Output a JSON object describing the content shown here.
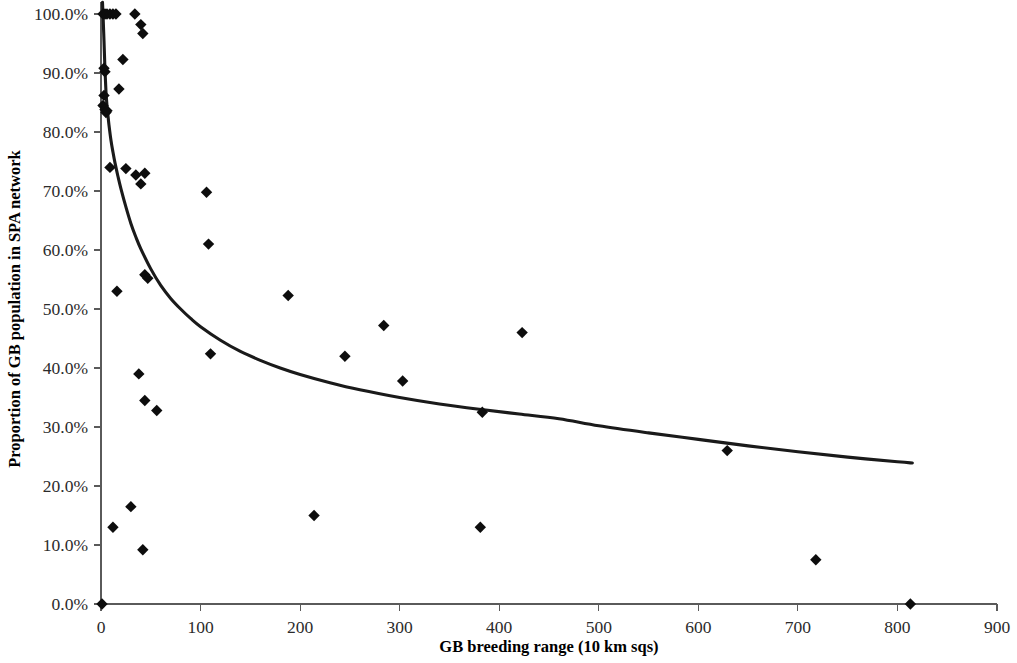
{
  "chart_data": {
    "type": "scatter",
    "title": "",
    "subtitle": "",
    "xlabel": "GB breeding range (10 km sqs)",
    "ylabel": "Proportion of GB population in SPA network",
    "xlim": [
      0,
      900
    ],
    "ylim": [
      0,
      1.0
    ],
    "xticks": [
      0,
      100,
      200,
      300,
      400,
      500,
      600,
      700,
      800,
      900
    ],
    "xticklabels": [
      "0",
      "100",
      "200",
      "300",
      "400",
      "500",
      "600",
      "700",
      "800",
      "900"
    ],
    "yticks": [
      0,
      0.1,
      0.2,
      0.3,
      0.4,
      0.5,
      0.6,
      0.7,
      0.8,
      0.9,
      1.0
    ],
    "yticklabels": [
      "0.0%",
      "10.0%",
      "20.0%",
      "30.0%",
      "40.0%",
      "50.0%",
      "60.0%",
      "70.0%",
      "80.0%",
      "90.0%",
      "100.0%"
    ],
    "grid": false,
    "legend": null,
    "legend_position": "none",
    "marker_shape": "diamond",
    "marker_color": "#0d0d0d",
    "marker_size": 9,
    "series": [
      {
        "name": "Species",
        "points": [
          [
            2,
            1.0
          ],
          [
            4,
            1.0
          ],
          [
            6,
            1.0
          ],
          [
            9,
            1.0
          ],
          [
            12,
            1.0
          ],
          [
            15,
            1.0
          ],
          [
            34,
            1.0
          ],
          [
            40,
            0.982
          ],
          [
            42,
            0.967
          ],
          [
            3,
            0.908
          ],
          [
            4,
            0.902
          ],
          [
            22,
            0.923
          ],
          [
            18,
            0.873
          ],
          [
            3,
            0.862
          ],
          [
            2,
            0.845
          ],
          [
            4,
            0.838
          ],
          [
            5,
            0.833
          ],
          [
            6,
            0.836
          ],
          [
            9,
            0.74
          ],
          [
            25,
            0.738
          ],
          [
            35,
            0.727
          ],
          [
            44,
            0.73
          ],
          [
            40,
            0.712
          ],
          [
            106,
            0.698
          ],
          [
            108,
            0.61
          ],
          [
            44,
            0.558
          ],
          [
            47,
            0.552
          ],
          [
            16,
            0.53
          ],
          [
            188,
            0.523
          ],
          [
            284,
            0.472
          ],
          [
            423,
            0.46
          ],
          [
            245,
            0.42
          ],
          [
            110,
            0.424
          ],
          [
            303,
            0.378
          ],
          [
            38,
            0.39
          ],
          [
            383,
            0.325
          ],
          [
            629,
            0.26
          ],
          [
            44,
            0.345
          ],
          [
            56,
            0.328
          ],
          [
            30,
            0.165
          ],
          [
            214,
            0.15
          ],
          [
            381,
            0.13
          ],
          [
            12,
            0.13
          ],
          [
            42,
            0.092
          ],
          [
            718,
            0.075
          ],
          [
            813,
            0.0
          ],
          [
            1,
            0.0
          ]
        ]
      }
    ],
    "fit_curve": {
      "name": "power-law fit",
      "color": "#1a1a1a",
      "points": [
        [
          1.5,
          1.02
        ],
        [
          2,
          1.0
        ],
        [
          3,
          0.955
        ],
        [
          4,
          0.905
        ],
        [
          5,
          0.868
        ],
        [
          6,
          0.845
        ],
        [
          7,
          0.828
        ],
        [
          8,
          0.812
        ],
        [
          10,
          0.786
        ],
        [
          12,
          0.766
        ],
        [
          14,
          0.748
        ],
        [
          17,
          0.725
        ],
        [
          20,
          0.704
        ],
        [
          25,
          0.673
        ],
        [
          30,
          0.645
        ],
        [
          35,
          0.622
        ],
        [
          40,
          0.602
        ],
        [
          50,
          0.568
        ],
        [
          60,
          0.54
        ],
        [
          70,
          0.518
        ],
        [
          80,
          0.5
        ],
        [
          90,
          0.484
        ],
        [
          100,
          0.47
        ],
        [
          120,
          0.447
        ],
        [
          140,
          0.428
        ],
        [
          160,
          0.413
        ],
        [
          180,
          0.4
        ],
        [
          200,
          0.389
        ],
        [
          230,
          0.375
        ],
        [
          260,
          0.363
        ],
        [
          300,
          0.35
        ],
        [
          340,
          0.339
        ],
        [
          380,
          0.33
        ],
        [
          420,
          0.322
        ],
        [
          460,
          0.314
        ],
        [
          500,
          0.302
        ],
        [
          550,
          0.29
        ],
        [
          600,
          0.279
        ],
        [
          650,
          0.268
        ],
        [
          700,
          0.258
        ],
        [
          750,
          0.249
        ],
        [
          800,
          0.241
        ],
        [
          815,
          0.239
        ]
      ]
    }
  }
}
